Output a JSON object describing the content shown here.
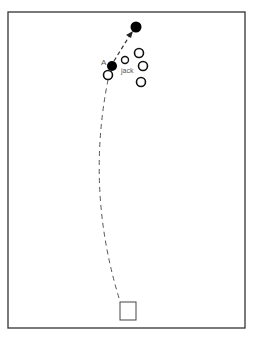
{
  "diagram": {
    "type": "bowls-green-plan",
    "labels": {
      "bowl_a": "A",
      "jack": "jack"
    },
    "colors": {
      "line": "#333333",
      "bowl_fill_dark": "#000000",
      "bowl_open_fill": "#ffffff",
      "label": "#555555"
    },
    "elements": {
      "rink_border": {
        "x": 8,
        "y": 12,
        "width": 237,
        "height": 316
      },
      "mat": {
        "x": 120,
        "y": 302,
        "width": 16,
        "height": 18
      },
      "delivery_path": {
        "from": [
          119,
          298
        ],
        "via": [
          95,
          180
        ],
        "to": [
          108,
          80
        ],
        "style": "dashed"
      },
      "knock_path": {
        "from": [
          114,
          61
        ],
        "to": [
          133,
          31
        ],
        "style": "dashed-arrow"
      },
      "bowls_dark": [
        {
          "id": "A",
          "cx": 112,
          "cy": 66,
          "r": 5
        },
        {
          "id": "knocked",
          "cx": 136,
          "cy": 27,
          "r": 5.5
        }
      ],
      "bowls_open": [
        {
          "cx": 108,
          "cy": 75,
          "r": 4.5
        },
        {
          "cx": 139,
          "cy": 53,
          "r": 4.5
        },
        {
          "cx": 143,
          "cy": 66,
          "r": 4.5
        },
        {
          "cx": 141,
          "cy": 82,
          "r": 4.5
        }
      ],
      "jack": {
        "cx": 125,
        "cy": 60,
        "r": 3.5
      }
    }
  }
}
